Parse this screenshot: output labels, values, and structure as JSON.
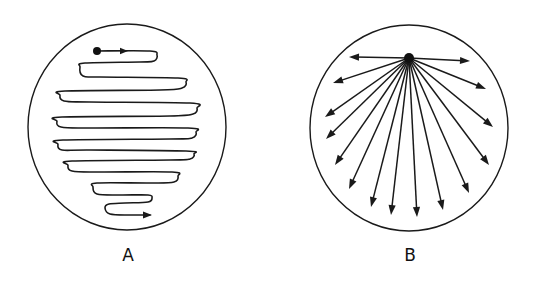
{
  "figure": {
    "panels": [
      {
        "id": "A",
        "label": "A",
        "description": "Zigzag (serpentine) scanning path inside a circular field, starting at a dot near the top and ending with an arrow near the bottom",
        "circle": {
          "cx": 127,
          "cy": 127,
          "rx": 99,
          "ry": 103
        },
        "start_dot": {
          "x": 97,
          "y": 51,
          "r": 4
        },
        "path_points": [
          [
            97,
            51
          ],
          [
            150,
            51
          ],
          [
            157,
            55
          ],
          [
            154,
            61
          ],
          [
            140,
            62
          ],
          [
            85,
            63
          ],
          [
            80,
            67
          ],
          [
            83,
            76
          ],
          [
            100,
            77
          ],
          [
            178,
            78
          ],
          [
            186,
            82
          ],
          [
            182,
            88
          ],
          [
            160,
            90
          ],
          [
            65,
            91
          ],
          [
            60,
            95
          ],
          [
            64,
            101
          ],
          [
            90,
            102
          ],
          [
            190,
            103
          ],
          [
            197,
            108
          ],
          [
            193,
            114
          ],
          [
            170,
            116
          ],
          [
            62,
            117
          ],
          [
            57,
            121
          ],
          [
            61,
            127
          ],
          [
            90,
            128
          ],
          [
            188,
            128
          ],
          [
            196,
            132
          ],
          [
            192,
            138
          ],
          [
            170,
            139
          ],
          [
            63,
            140
          ],
          [
            58,
            144
          ],
          [
            62,
            150
          ],
          [
            90,
            150
          ],
          [
            186,
            151
          ],
          [
            194,
            154
          ],
          [
            190,
            159
          ],
          [
            170,
            160
          ],
          [
            72,
            161
          ],
          [
            68,
            165
          ],
          [
            72,
            171
          ],
          [
            100,
            172
          ],
          [
            172,
            172
          ],
          [
            178,
            176
          ],
          [
            174,
            182
          ],
          [
            150,
            183
          ],
          [
            97,
            183
          ],
          [
            93,
            187
          ],
          [
            97,
            194
          ],
          [
            120,
            195
          ],
          [
            148,
            195
          ],
          [
            152,
            198
          ],
          [
            148,
            202
          ],
          [
            125,
            203
          ],
          [
            109,
            204
          ],
          [
            105,
            208
          ],
          [
            110,
            214
          ],
          [
            130,
            215
          ],
          [
            150,
            215
          ]
        ],
        "end_arrow": {
          "x": 152,
          "y": 215,
          "direction": "right"
        },
        "start_arrow": {
          "x": 128,
          "y": 51,
          "direction": "right"
        }
      },
      {
        "id": "B",
        "label": "B",
        "description": "Radial fan of arrows emanating from a single point near the top of a circular field",
        "circle": {
          "cx": 409,
          "cy": 128,
          "rx": 99,
          "ry": 103
        },
        "hub": {
          "x": 409,
          "y": 58,
          "r": 5
        },
        "arrow_tips": [
          [
            349,
            57
          ],
          [
            470,
            61
          ],
          [
            333,
            83
          ],
          [
            486,
            89
          ],
          [
            325,
            117
          ],
          [
            493,
            127
          ],
          [
            326,
            139
          ],
          [
            335,
            165
          ],
          [
            489,
            165
          ],
          [
            349,
            189
          ],
          [
            469,
            193
          ],
          [
            371,
            207
          ],
          [
            443,
            210
          ],
          [
            391,
            215
          ],
          [
            417,
            217
          ]
        ]
      }
    ],
    "stroke_color": "#1a1a1a",
    "background": "#ffffff"
  }
}
